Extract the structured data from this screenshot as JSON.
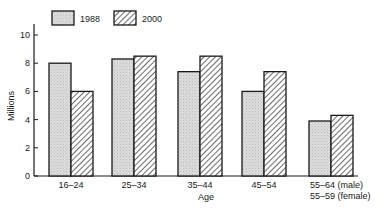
{
  "chart_data": {
    "type": "bar",
    "title": "",
    "xlabel": "Age",
    "ylabel": "Millions",
    "ylim": [
      0,
      10
    ],
    "yticks": [
      0,
      2,
      4,
      6,
      8,
      10
    ],
    "grid": false,
    "legend_position": "top-left",
    "categories": [
      "16–24",
      "25–34",
      "35–44",
      "45–54",
      "55–64 (male)\n55–59 (female)"
    ],
    "category_lines": [
      [
        "16–24"
      ],
      [
        "25–34"
      ],
      [
        "35–44"
      ],
      [
        "45–54"
      ],
      [
        "55–64  (male)",
        "55–59  (female)"
      ]
    ],
    "series": [
      {
        "name": "1988",
        "pattern": "dotted-grey",
        "values": [
          8.0,
          8.3,
          7.4,
          6.0,
          3.9
        ]
      },
      {
        "name": "2000",
        "pattern": "diagonal-hatch",
        "values": [
          6.0,
          8.5,
          8.5,
          7.4,
          4.3
        ]
      }
    ]
  },
  "colors": {
    "fill_1988": "#d9d9d9",
    "hatch_2000": "#1a1a1a",
    "outline": "#1a1a1a"
  }
}
